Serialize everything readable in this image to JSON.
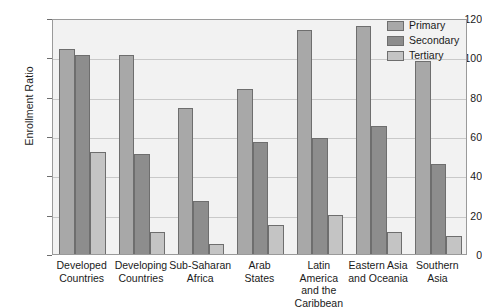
{
  "chart_data": {
    "type": "bar",
    "title": "",
    "subtitle": "",
    "xlabel": "",
    "ylabel": "Enrollment Ratio",
    "ylim": [
      0,
      120
    ],
    "yticks": [
      0,
      20,
      40,
      60,
      80,
      100,
      120
    ],
    "ytick_labels": [
      "0",
      "20",
      "40",
      "60",
      "80",
      "100",
      "120"
    ],
    "grid": true,
    "legend_position": "top-right",
    "categories": [
      "Developed Countries",
      "Developing Countries",
      "Sub-Saharan Africa",
      "Arab States",
      "Latin America and the Caribbean",
      "Eastern Asia and Oceania",
      "Southern Asia"
    ],
    "category_lines": [
      [
        "Developed",
        "Countries"
      ],
      [
        "Developing",
        "Countries"
      ],
      [
        "Sub-Saharan",
        "Africa"
      ],
      [
        "Arab",
        "States"
      ],
      [
        "Latin",
        "America",
        "and the",
        "Caribbean"
      ],
      [
        "Eastern Asia",
        "and Oceania"
      ],
      [
        "Southern",
        "Asia"
      ]
    ],
    "series": [
      {
        "name": "Primary",
        "color": "#a8a8a8",
        "values": [
          104,
          101,
          74,
          84,
          114,
          116,
          98
        ]
      },
      {
        "name": "Secondary",
        "color": "#8d8d8d",
        "values": [
          101,
          51,
          27,
          57,
          59,
          65,
          46
        ]
      },
      {
        "name": "Tertiary",
        "color": "#c4c4c4",
        "values": [
          52,
          11,
          5,
          15,
          20,
          11,
          9
        ]
      }
    ]
  },
  "legend": {
    "items": [
      {
        "label": "Primary"
      },
      {
        "label": "Secondary"
      },
      {
        "label": "Tertiary"
      }
    ]
  },
  "colors": {
    "plot_background": "#f2f2f2",
    "page_background": "#ffffff",
    "gridline": "#c9c9c9",
    "axis": "#9a9a9a",
    "bar_outline": "#6e6e6e",
    "text": "#1a1a1a"
  }
}
